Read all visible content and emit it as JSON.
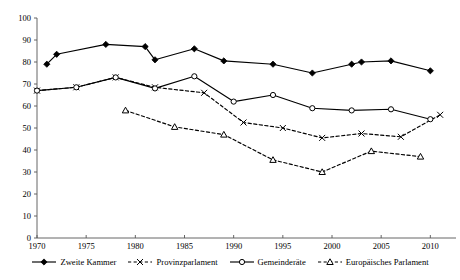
{
  "chart_data": {
    "type": "line",
    "title": "",
    "xlabel": "",
    "ylabel": "",
    "xlim": [
      1970,
      2012
    ],
    "ylim": [
      0,
      100
    ],
    "xticks": [
      1970,
      1975,
      1980,
      1985,
      1990,
      1995,
      2000,
      2005,
      2010
    ],
    "yticks": [
      0,
      10,
      20,
      30,
      40,
      50,
      60,
      70,
      80,
      90,
      100
    ],
    "grid": false,
    "legend_position": "bottom",
    "series": [
      {
        "name": "Zweite Kammer",
        "marker": "filled-diamond",
        "linestyle": "solid",
        "color": "#000000",
        "points": [
          {
            "x": 1971,
            "y": 79
          },
          {
            "x": 1972,
            "y": 83.5
          },
          {
            "x": 1977,
            "y": 88
          },
          {
            "x": 1981,
            "y": 87
          },
          {
            "x": 1982,
            "y": 81
          },
          {
            "x": 1986,
            "y": 86
          },
          {
            "x": 1989,
            "y": 80.5
          },
          {
            "x": 1994,
            "y": 79
          },
          {
            "x": 1998,
            "y": 75
          },
          {
            "x": 2002,
            "y": 79
          },
          {
            "x": 2003,
            "y": 80
          },
          {
            "x": 2006,
            "y": 80.5
          },
          {
            "x": 2010,
            "y": 76
          }
        ]
      },
      {
        "name": "Provinzparlament",
        "marker": "cross-x",
        "linestyle": "dashed",
        "color": "#000000",
        "points": [
          {
            "x": 1970,
            "y": 67
          },
          {
            "x": 1974,
            "y": 68.5
          },
          {
            "x": 1978,
            "y": 73
          },
          {
            "x": 1982,
            "y": 68.5
          },
          {
            "x": 1987,
            "y": 66
          },
          {
            "x": 1991,
            "y": 52.5
          },
          {
            "x": 1995,
            "y": 50
          },
          {
            "x": 1999,
            "y": 45.5
          },
          {
            "x": 2003,
            "y": 47.5
          },
          {
            "x": 2007,
            "y": 46
          },
          {
            "x": 2011,
            "y": 56
          }
        ]
      },
      {
        "name": "Gemeinderäte",
        "marker": "open-circle",
        "linestyle": "solid",
        "color": "#000000",
        "points": [
          {
            "x": 1970,
            "y": 67
          },
          {
            "x": 1974,
            "y": 68.5
          },
          {
            "x": 1978,
            "y": 73
          },
          {
            "x": 1982,
            "y": 68
          },
          {
            "x": 1986,
            "y": 73.5
          },
          {
            "x": 1990,
            "y": 62
          },
          {
            "x": 1994,
            "y": 65
          },
          {
            "x": 1998,
            "y": 59
          },
          {
            "x": 2002,
            "y": 58
          },
          {
            "x": 2006,
            "y": 58.5
          },
          {
            "x": 2010,
            "y": 54
          }
        ]
      },
      {
        "name": "Europäisches Parlament",
        "marker": "open-triangle",
        "linestyle": "dashed",
        "color": "#000000",
        "points": [
          {
            "x": 1979,
            "y": 58
          },
          {
            "x": 1984,
            "y": 50.5
          },
          {
            "x": 1989,
            "y": 47
          },
          {
            "x": 1994,
            "y": 35.5
          },
          {
            "x": 1999,
            "y": 30
          },
          {
            "x": 2004,
            "y": 39.5
          },
          {
            "x": 2009,
            "y": 37
          }
        ]
      }
    ]
  },
  "legend": {
    "items": [
      {
        "label": "Zweite Kammer",
        "icon": "filled-diamond-marker-icon"
      },
      {
        "label": "Provinzparlament",
        "icon": "cross-x-marker-icon"
      },
      {
        "label": "Gemeinderäte",
        "icon": "open-circle-marker-icon"
      },
      {
        "label": "Europäisches Parlament",
        "icon": "open-triangle-marker-icon"
      }
    ]
  }
}
